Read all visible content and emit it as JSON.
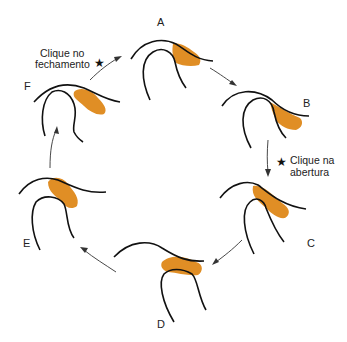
{
  "diagram": {
    "stages": [
      {
        "id": "A",
        "label": "A"
      },
      {
        "id": "B",
        "label": "B"
      },
      {
        "id": "C",
        "label": "C"
      },
      {
        "id": "D",
        "label": "D"
      },
      {
        "id": "E",
        "label": "E"
      },
      {
        "id": "F",
        "label": "F"
      }
    ],
    "annotations": {
      "closing_click": {
        "line1": "Clique no",
        "line2": "fechamento",
        "icon": "star-icon"
      },
      "opening_click": {
        "line1": "Clique na",
        "line2": "abertura",
        "icon": "star-icon"
      }
    },
    "star_glyph": "★",
    "colors": {
      "line": "#111111",
      "arrow": "#333333",
      "disc": "#e08e25",
      "background": "#ffffff"
    },
    "cycle_order": [
      "A",
      "B",
      "C",
      "D",
      "E",
      "F"
    ]
  }
}
